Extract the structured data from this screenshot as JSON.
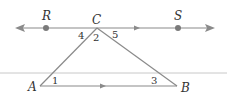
{
  "diagram": {
    "points": {
      "R": {
        "label": "R"
      },
      "C": {
        "label": "C"
      },
      "S": {
        "label": "S"
      },
      "A": {
        "label": "A"
      },
      "B": {
        "label": "B"
      }
    },
    "angles": [
      "4",
      "2",
      "5",
      "1",
      "3"
    ],
    "colors": {
      "line": "#8a8a8a",
      "dot": "#7a7a7a",
      "text": "#333333",
      "rule": "#c8c8c8"
    }
  }
}
